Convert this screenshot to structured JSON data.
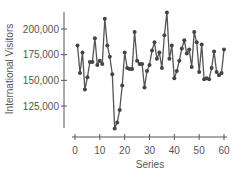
{
  "chart_data": {
    "type": "line",
    "title": "",
    "xlabel": "Series",
    "ylabel": "International Visitors",
    "x": [
      1,
      2,
      3,
      4,
      5,
      6,
      7,
      8,
      9,
      10,
      11,
      12,
      13,
      14,
      15,
      16,
      17,
      18,
      19,
      20,
      21,
      22,
      23,
      24,
      25,
      26,
      27,
      28,
      29,
      30,
      31,
      32,
      33,
      34,
      35,
      36,
      37,
      38,
      39,
      40,
      41,
      42,
      43,
      44,
      45,
      46,
      47,
      48,
      49,
      50,
      51,
      52,
      53,
      54,
      55,
      56,
      57,
      58,
      59,
      60
    ],
    "series": [
      {
        "name": "International Visitors",
        "values": [
          184000,
          157000,
          177000,
          141000,
          153000,
          168000,
          168000,
          191000,
          165000,
          169000,
          166000,
          210000,
          184000,
          173000,
          156000,
          103000,
          109000,
          121000,
          145000,
          177000,
          162000,
          161000,
          161000,
          197000,
          169000,
          166000,
          166000,
          143000,
          159000,
          165000,
          179000,
          187000,
          171000,
          177000,
          162000,
          194000,
          216000,
          171000,
          184000,
          152000,
          159000,
          169000,
          181000,
          189000,
          176000,
          180000,
          163000,
          197000,
          187000,
          158000,
          185000,
          151000,
          152000,
          151000,
          162000,
          178000,
          158000,
          155000,
          157000,
          180000
        ]
      }
    ],
    "xlim": [
      0,
      60
    ],
    "ylim": [
      100000,
      220000
    ],
    "x_ticks": [
      0,
      10,
      20,
      30,
      40,
      50,
      60
    ],
    "x_tick_labels": [
      "0",
      "10",
      "20",
      "30",
      "40",
      "50",
      "60"
    ],
    "y_ticks": [
      125000,
      150000,
      175000,
      200000
    ],
    "y_tick_labels": [
      "125,000",
      "150,000",
      "175,000",
      "200,000"
    ],
    "grid": false,
    "legend": "none",
    "colors": {
      "line": "#555555",
      "marker": "#444444",
      "axis": "#555555",
      "text": "#555555"
    }
  }
}
